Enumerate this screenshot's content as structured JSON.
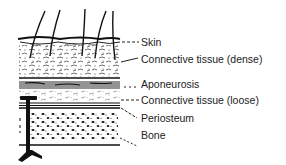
{
  "figure": {
    "colors": {
      "ink": "#1a1a1a",
      "background": "#ffffff",
      "label_text": "#222222"
    },
    "layers": [
      {
        "id": "skin",
        "label": "Skin",
        "label_y": 36,
        "leader": "dashed"
      },
      {
        "id": "connective-dense",
        "label": "Connective tissue (dense)",
        "label_y": 53,
        "leader": "solid"
      },
      {
        "id": "aponeurosis",
        "label": "Aponeurosis",
        "label_y": 78,
        "leader": "dashed"
      },
      {
        "id": "connective-loose",
        "label": "Connective tissue (loose)",
        "label_y": 94,
        "leader": "dashed"
      },
      {
        "id": "periosteum",
        "label": "Periosteum",
        "label_y": 112,
        "leader": "dashed"
      },
      {
        "id": "bone",
        "label": "Bone",
        "label_y": 129,
        "leader": "dashed"
      }
    ],
    "instrument": "t-shaped-probe"
  }
}
